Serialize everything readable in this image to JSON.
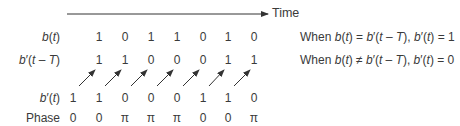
{
  "time_axis": {
    "label": "Time"
  },
  "rows": [
    {
      "label_html": "<i>b</i>(<i>t</i>)",
      "name": "b",
      "values": [
        "",
        "1",
        "0",
        "1",
        "1",
        "0",
        "1",
        "0"
      ]
    },
    {
      "label_html": "<i>b</i>′(<i>t</i> – <i>T</i>)",
      "name": "b-prime-delayed",
      "values": [
        "",
        "1",
        "1",
        "0",
        "0",
        "0",
        "1",
        "1"
      ]
    },
    {
      "label_html": "<i>b</i>′(<i>t</i>)",
      "name": "b-prime",
      "values": [
        "1",
        "1",
        "0",
        "0",
        "0",
        "1",
        "1",
        "0"
      ]
    },
    {
      "label_html": "Phase",
      "name": "phase",
      "values": [
        "0",
        "0",
        "π",
        "π",
        "π",
        "0",
        "0",
        "π"
      ]
    }
  ],
  "notes": [
    "When <i>b</i>(<i>t</i>) = <i>b</i>′(<i>t</i> – <i>T</i>), <i>b</i>′(<i>t</i>) = 1",
    "When <i>b</i>(<i>t</i>) ≠ <i>b</i>′(<i>t</i> – <i>T</i>), <i>b</i>′(<i>t</i>) = 0"
  ],
  "colors": {
    "text": "#3a3a3a",
    "line": "#333333"
  }
}
